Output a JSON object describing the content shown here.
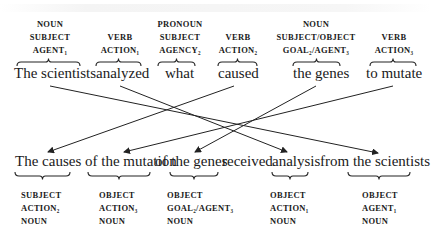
{
  "top_row": [
    {
      "id": "the-scientists",
      "text": "The scientists",
      "labels": [
        "NOUN",
        "SUBJECT",
        "AGENT₁"
      ]
    },
    {
      "id": "analyzed",
      "text": "analyzed",
      "labels": [
        "VERB",
        "ACTION₁"
      ]
    },
    {
      "id": "what",
      "text": "what",
      "labels": [
        "PRONOUN",
        "SUBJECT",
        "AGENCY₂"
      ]
    },
    {
      "id": "caused",
      "text": "caused",
      "labels": [
        "VERB",
        "ACTION₂"
      ]
    },
    {
      "id": "the-genes",
      "text": "the genes",
      "labels": [
        "NOUN",
        "SUBJECT/OBJECT",
        "GOAL₂/AGENT₃"
      ]
    },
    {
      "id": "to-mutate",
      "text": "to mutate",
      "labels": [
        "VERB",
        "ACTION₃"
      ]
    }
  ],
  "bottom_sentence": {
    "segments": [
      "The causes",
      "of the mutation",
      "of the genes",
      "received",
      "analysis",
      "from the scientists"
    ]
  },
  "bottom_labels": [
    {
      "id": "causes",
      "labels": [
        "SUBJECT",
        "ACTION₂",
        "NOUN"
      ]
    },
    {
      "id": "mutation",
      "labels": [
        "OBJECT",
        "ACTION₃",
        "NOUN"
      ]
    },
    {
      "id": "genes",
      "labels": [
        "OBJECT",
        "GOAL₂/AGENT₃",
        "NOUN"
      ]
    },
    {
      "id": "analysis",
      "labels": [
        "OBJECT",
        "ACTION₁",
        "NOUN"
      ]
    },
    {
      "id": "scientists",
      "labels": [
        "OBJECT",
        "AGENT₁",
        "NOUN"
      ]
    }
  ],
  "mappings": [
    {
      "from": "the-scientists",
      "to": "scientists"
    },
    {
      "from": "analyzed",
      "to": "analysis"
    },
    {
      "from": "caused",
      "to": "causes"
    },
    {
      "from": "the-genes",
      "to": "genes"
    },
    {
      "from": "to-mutate",
      "to": "mutation"
    }
  ]
}
